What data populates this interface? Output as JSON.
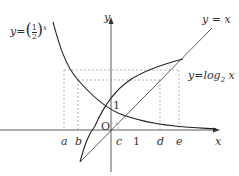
{
  "labels": {
    "exp_fn": "y=(1/2)^x",
    "exp_prefix": "y=",
    "exp_num": "1",
    "exp_den": "2",
    "exp_pow": "x",
    "line_fn": "y = x",
    "log_fn": "y=log",
    "log_base": "2",
    "log_arg": " x",
    "y_axis": "y",
    "x_axis": "x",
    "origin": "O",
    "one_y": "1",
    "one_x": "1",
    "a": "a",
    "b": "b",
    "c": "c",
    "d": "d",
    "e": "e"
  },
  "colors": {
    "curve": "#222222",
    "axis": "#333333",
    "dash": "#888888"
  }
}
